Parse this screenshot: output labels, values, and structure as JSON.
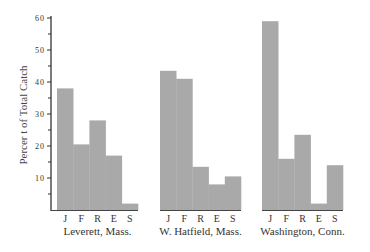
{
  "chart_data": {
    "type": "bar",
    "title": "",
    "xlabel": "",
    "ylabel": "Percer t of Total Catch",
    "ylim": [
      0,
      60
    ],
    "yticks": [
      10,
      20,
      30,
      40,
      50,
      60
    ],
    "grid": false,
    "categories": [
      "J",
      "F",
      "R",
      "E",
      "S"
    ],
    "bar_color": "#a9a9a9",
    "groups": [
      {
        "name": "Leverett, Mass.",
        "values": [
          38,
          20.5,
          28,
          17,
          2
        ]
      },
      {
        "name": "W. Hatfield, Mass.",
        "values": [
          43.5,
          41,
          13.5,
          8,
          10.5
        ]
      },
      {
        "name": "Washington, Conn.",
        "values": [
          59,
          16,
          23.5,
          2,
          14
        ]
      }
    ]
  }
}
